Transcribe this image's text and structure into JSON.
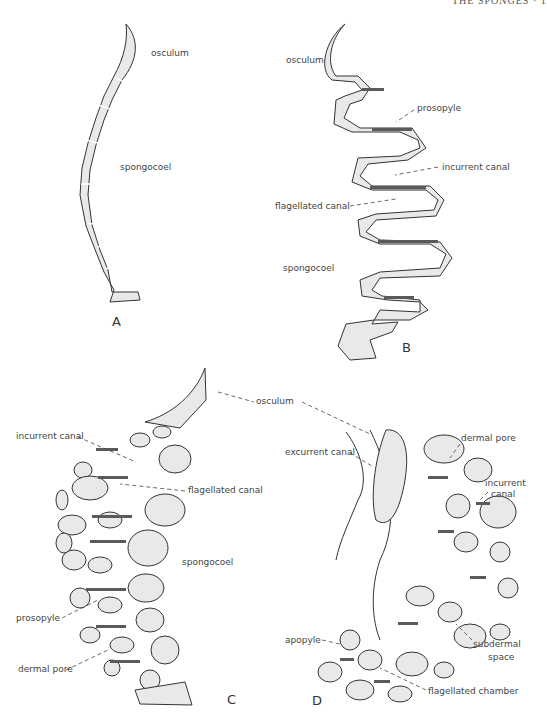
{
  "page": {
    "running_head": "THE SPONGES · 1"
  },
  "figures": [
    {
      "panel": "A",
      "labels": {
        "osculum": "osculum",
        "spongocoel": "spongocoel"
      }
    },
    {
      "panel": "B",
      "labels": {
        "osculum": "osculum",
        "prosopyle": "prosopyle",
        "incurrent_canal": "incurrent canal",
        "flagellated_canal": "flagellated canal",
        "spongocoel": "spongocoel"
      }
    },
    {
      "panel": "C",
      "labels": {
        "incurrent_canal": "incurrent canal",
        "flagellated_canal": "flagellated canal",
        "spongocoel": "spongocoel",
        "prosopyle": "prosopyle",
        "dermal_pore": "dermal pore"
      }
    },
    {
      "panel": "D",
      "labels": {
        "osculum": "osculum",
        "excurrent_canal": "excurrent canal",
        "dermal_pore": "dermal pore",
        "incurrent_canal_1": "incurrent",
        "incurrent_canal_2": "canal",
        "apopyle": "apopyle",
        "subdermal_space_1": "subdermal",
        "subdermal_space_2": "space",
        "flagellated_chamber": "flagellated chamber"
      }
    }
  ]
}
